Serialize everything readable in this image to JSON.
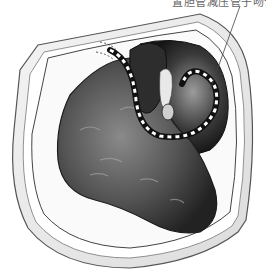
{
  "figure": {
    "type": "medical-illustration",
    "caption_label": "置胆管减压管于吻合口",
    "colors": {
      "background": "#ffffff",
      "wound_edge": "#e8e8e8",
      "wound_outline": "#555555",
      "organ_dark": "#2a2a2a",
      "organ_mid": "#6a6a6a",
      "organ_light": "#9a9a9a",
      "catheter_dark": "#111111",
      "catheter_light": "#ffffff"
    }
  }
}
